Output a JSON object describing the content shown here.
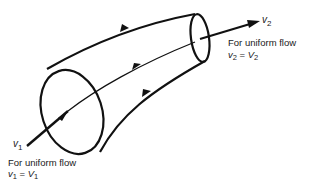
{
  "diagram": {
    "inlet": {
      "velocity_symbol": "v",
      "velocity_subscript": "1",
      "note": "For uniform flow",
      "eq_lhs": "v",
      "eq_lhs_sub": "1",
      "eq_sign": " = ",
      "eq_rhs": "V",
      "eq_rhs_sub": "1"
    },
    "outlet": {
      "velocity_symbol": "v",
      "velocity_subscript": "2",
      "note": "For uniform flow",
      "eq_lhs": "v",
      "eq_lhs_sub": "2",
      "eq_sign": " = ",
      "eq_rhs": "V",
      "eq_rhs_sub": "2"
    },
    "colors": {
      "stroke": "#111111",
      "background": "#ffffff"
    }
  }
}
